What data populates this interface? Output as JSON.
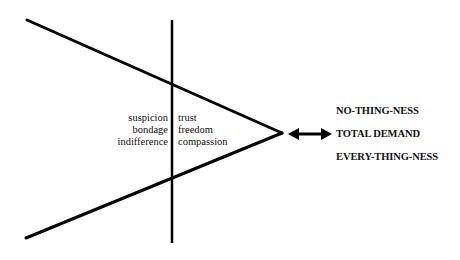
{
  "diagram": {
    "left_labels": [
      "suspicion",
      "bondage",
      "indifference"
    ],
    "right_labels": [
      "trust",
      "freedom",
      "compassion"
    ],
    "arrow": "double-headed-arrow",
    "poles": [
      "NO-THING-NESS",
      "TOTAL DEMAND",
      "EVERY-THING-NESS"
    ],
    "line_color": "#000000"
  }
}
